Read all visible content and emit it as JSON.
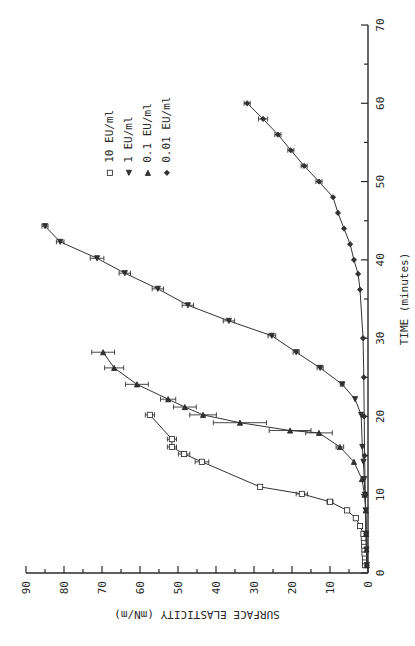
{
  "chart_data": {
    "type": "line",
    "orientation": "rotated 90 degrees counter-clockwise",
    "title": "",
    "xlabel": "TIME (minutes)",
    "ylabel": "SURFACE ELASTICITY (mN/m)",
    "xlim": [
      0,
      70
    ],
    "ylim": [
      0,
      90
    ],
    "xticks": [
      0,
      10,
      20,
      30,
      40,
      50,
      60,
      70
    ],
    "yticks": [
      0,
      10,
      20,
      30,
      40,
      50,
      60,
      70,
      80,
      90
    ],
    "grid": false,
    "legend_position": "top-left",
    "series": [
      {
        "name": "10 EU/ml",
        "marker": "square",
        "x": [
          1,
          1.5,
          2,
          2.5,
          3,
          3.5,
          4,
          4.5,
          5,
          6,
          7,
          8,
          9.1,
          10.1,
          11,
          14.2,
          15.2,
          16.1,
          17.1,
          20.2
        ],
        "y": [
          0.8,
          0.8,
          0.8,
          0.9,
          0.9,
          1.0,
          1.0,
          1.1,
          1.2,
          2.1,
          3.2,
          5.5,
          10.0,
          17.4,
          28.4,
          43.7,
          48.4,
          51.6,
          51.6,
          57.4
        ],
        "err": [
          0,
          0,
          0,
          0,
          0,
          0,
          0,
          0,
          0,
          0,
          0,
          0,
          0.8,
          1.5,
          0,
          1.8,
          1.5,
          1.2,
          1.2,
          1.2
        ]
      },
      {
        "name": "1 EU/ml",
        "marker": "triangle-up",
        "x": [
          1,
          3,
          5,
          8,
          10,
          12,
          14.2,
          16.1,
          20.2,
          22.2,
          24.1,
          26.2,
          28.2,
          30.3,
          32.2,
          34.2,
          36.3,
          38.3,
          40.2,
          42.3,
          44.3
        ],
        "y": [
          0.3,
          0.4,
          0.5,
          0.6,
          0.8,
          1.0,
          1.2,
          1.5,
          1.8,
          3.4,
          6.8,
          12.6,
          18.9,
          25.3,
          36.6,
          47.4,
          55.3,
          64.0,
          71.3,
          81.0,
          85.0
        ],
        "err": [
          0,
          0,
          0,
          0,
          0,
          0,
          0,
          0,
          0,
          0,
          0.5,
          0.8,
          0.8,
          1.0,
          1.5,
          1.5,
          1.5,
          1.5,
          1.8,
          1.0,
          0.8
        ]
      },
      {
        "name": "0.1 EU/ml",
        "marker": "triangle-down",
        "x": [
          1,
          3,
          5,
          8,
          10,
          12.0,
          14.2,
          16.1,
          17.9,
          18.2,
          19.2,
          20.2,
          21.2,
          22.2,
          24.1,
          26.2,
          28.2
        ],
        "y": [
          0.3,
          0.4,
          0.5,
          0.6,
          0.9,
          1.6,
          3.7,
          7.4,
          12.9,
          20.5,
          33.7,
          43.4,
          48.2,
          52.6,
          60.8,
          66.8,
          69.7
        ],
        "err": [
          0,
          0,
          0,
          0,
          0,
          0,
          0,
          1.0,
          3.5,
          5.5,
          7.0,
          3.5,
          3.0,
          2.0,
          3.0,
          2.5,
          3.0
        ]
      },
      {
        "name": "0.01 EU/ml",
        "marker": "diamond",
        "x": [
          1,
          5,
          10,
          15,
          20,
          25,
          30,
          36.2,
          38.2,
          40,
          42,
          44,
          46,
          48,
          50,
          52,
          54,
          56,
          58,
          60
        ],
        "y": [
          0.3,
          0.5,
          0.7,
          0.9,
          1.0,
          1.1,
          1.3,
          2.1,
          2.6,
          3.7,
          4.7,
          6.3,
          7.9,
          9.2,
          12.9,
          16.8,
          20.3,
          23.7,
          27.6,
          31.8
        ],
        "err": [
          0,
          0,
          0,
          0,
          0,
          0,
          0,
          0,
          0,
          0,
          0,
          0,
          0,
          0,
          0.8,
          0.8,
          0.8,
          0.8,
          1.2,
          0.8
        ]
      }
    ]
  }
}
